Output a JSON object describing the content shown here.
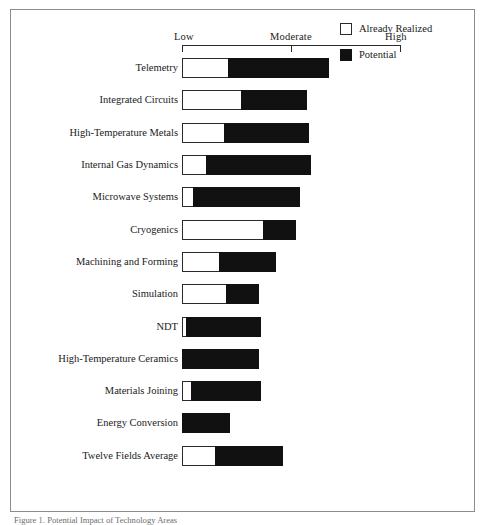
{
  "figure": {
    "caption": "Figure 1. Potential Impact of Technology Areas"
  },
  "legend": {
    "position": "top-right",
    "items": [
      {
        "label": "Already Realized",
        "swatch": "white-square-icon",
        "color": "#ffffff"
      },
      {
        "label": "Potential",
        "swatch": "black-square-icon",
        "color": "#111111"
      }
    ]
  },
  "axis": {
    "ticks": [
      "Low",
      "Moderate",
      "High"
    ],
    "min": 0,
    "max": 100
  },
  "chart_data": {
    "type": "bar",
    "orientation": "horizontal",
    "stacked": true,
    "title": "",
    "xlabel": "",
    "ylabel": "",
    "xlim": [
      0,
      100
    ],
    "xticklabels": [
      "Low",
      "Moderate",
      "High"
    ],
    "xtickvalues": [
      0,
      50,
      100
    ],
    "grid": false,
    "legend_position": "top-right",
    "categories": [
      "Telemetry",
      "Integrated Circuits",
      "High-Temperature Metals",
      "Internal Gas Dynamics",
      "Microwave Systems",
      "Cryogenics",
      "Machining and Forming",
      "Simulation",
      "NDT",
      "High-Temperature Ceramics",
      "Materials Joining",
      "Energy Conversion",
      "Twelve Fields Average"
    ],
    "series": [
      {
        "name": "Already Realized",
        "color": "#ffffff",
        "values": [
          21,
          27,
          19,
          11,
          5,
          37,
          17,
          20,
          2,
          0,
          4,
          0,
          15
        ]
      },
      {
        "name": "Potential",
        "color": "#111111",
        "values": [
          46,
          30,
          39,
          48,
          49,
          15,
          26,
          15,
          34,
          35,
          32,
          22,
          31
        ]
      }
    ],
    "totals": [
      67,
      57,
      58,
      59,
      54,
      52,
      43,
      35,
      36,
      35,
      36,
      22,
      46
    ]
  },
  "rows": [
    {
      "label": "Telemetry",
      "realized": 21,
      "potential": 46
    },
    {
      "label": "Integrated Circuits",
      "realized": 27,
      "potential": 30
    },
    {
      "label": "High-Temperature Metals",
      "realized": 19,
      "potential": 39
    },
    {
      "label": "Internal Gas Dynamics",
      "realized": 11,
      "potential": 48
    },
    {
      "label": "Microwave Systems",
      "realized": 5,
      "potential": 49
    },
    {
      "label": "Cryogenics",
      "realized": 37,
      "potential": 15
    },
    {
      "label": "Machining and Forming",
      "realized": 17,
      "potential": 26
    },
    {
      "label": "Simulation",
      "realized": 20,
      "potential": 15
    },
    {
      "label": "NDT",
      "realized": 2,
      "potential": 34
    },
    {
      "label": "High-Temperature Ceramics",
      "realized": 0,
      "potential": 35
    },
    {
      "label": "Materials Joining",
      "realized": 4,
      "potential": 32
    },
    {
      "label": "Energy Conversion",
      "realized": 0,
      "potential": 22
    },
    {
      "label": "Twelve Fields Average",
      "realized": 15,
      "potential": 31
    }
  ]
}
